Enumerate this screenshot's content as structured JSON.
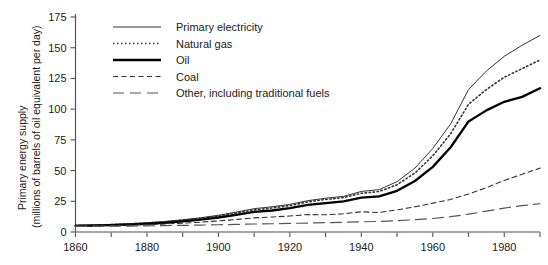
{
  "chart_data": {
    "type": "line",
    "title": "",
    "ylabel_line1": "Primary energy supply",
    "ylabel_line2": "(millions of barrels of oil equivalent per day)",
    "xlabel": "",
    "xlim": [
      1860,
      1990
    ],
    "ylim": [
      0,
      175
    ],
    "yticks": [
      0,
      25,
      50,
      75,
      100,
      125,
      150,
      175
    ],
    "ytick_labels": [
      "0",
      "25",
      "50",
      "75",
      "100",
      "125",
      "150",
      "175"
    ],
    "xticks_major": [
      1860,
      1880,
      1900,
      1920,
      1940,
      1960,
      1980
    ],
    "xtick_labels": [
      "1860",
      "1880",
      "1900",
      "1920",
      "1940",
      "1960",
      "1980"
    ],
    "xticks_minor": [
      1870,
      1890,
      1910,
      1930,
      1950,
      1970,
      1990
    ],
    "grid": false,
    "legend_position": "top-left-inside",
    "x": [
      1860,
      1865,
      1870,
      1875,
      1880,
      1885,
      1890,
      1895,
      1900,
      1905,
      1910,
      1915,
      1920,
      1925,
      1930,
      1935,
      1940,
      1945,
      1950,
      1955,
      1960,
      1965,
      1970,
      1975,
      1980,
      1985,
      1990
    ],
    "series": [
      {
        "name": "Primary electricity",
        "style": "thin-solid",
        "color": "#333333",
        "values": [
          5.5,
          5.8,
          6.2,
          6.8,
          7.6,
          8.6,
          10.0,
          11.6,
          13.6,
          16.2,
          19.0,
          20.5,
          22.5,
          25.5,
          27.5,
          29.0,
          33.0,
          34.5,
          41.0,
          52.0,
          68.0,
          88.0,
          116.0,
          131.0,
          143.0,
          152.0,
          160.0
        ]
      },
      {
        "name": "Natural gas",
        "style": "dotted",
        "color": "#333333",
        "values": [
          5.3,
          5.6,
          6.0,
          6.5,
          7.3,
          8.2,
          9.5,
          11.0,
          13.0,
          15.4,
          18.0,
          19.5,
          21.5,
          24.5,
          26.5,
          28.0,
          31.5,
          33.0,
          38.5,
          48.0,
          62.0,
          80.0,
          104.0,
          116.0,
          126.0,
          133.0,
          140.0
        ]
      },
      {
        "name": "Oil",
        "style": "thick-solid",
        "color": "#000000",
        "values": [
          5.0,
          5.2,
          5.6,
          6.0,
          6.6,
          7.4,
          8.6,
          10.0,
          11.8,
          14.0,
          16.4,
          17.5,
          19.5,
          22.0,
          23.5,
          25.0,
          28.0,
          29.0,
          33.5,
          41.5,
          53.0,
          69.0,
          90.0,
          99.0,
          106.0,
          110.0,
          117.0
        ]
      },
      {
        "name": "Coal",
        "style": "short-dash",
        "color": "#333333",
        "values": [
          5.0,
          5.1,
          5.3,
          5.6,
          6.0,
          6.5,
          7.2,
          8.0,
          9.0,
          10.2,
          11.5,
          12.2,
          13.0,
          14.2,
          14.0,
          14.8,
          16.5,
          15.8,
          18.0,
          20.5,
          23.5,
          26.5,
          31.0,
          36.0,
          42.0,
          47.0,
          52.0
        ]
      },
      {
        "name": "Other, including traditional fuels",
        "style": "long-dash",
        "color": "#555555",
        "values": [
          4.5,
          4.6,
          4.7,
          4.8,
          5.0,
          5.2,
          5.4,
          5.6,
          5.9,
          6.2,
          6.5,
          6.7,
          7.0,
          7.3,
          7.6,
          7.9,
          8.3,
          8.6,
          9.2,
          10.0,
          11.0,
          12.5,
          14.5,
          17.0,
          19.5,
          21.5,
          23.0
        ]
      }
    ],
    "legend": [
      {
        "label": "Primary electricity",
        "style": "thin-solid"
      },
      {
        "label": "Natural gas",
        "style": "dotted"
      },
      {
        "label": "Oil",
        "style": "thick-solid"
      },
      {
        "label": "Coal",
        "style": "short-dash"
      },
      {
        "label": "Other, including traditional fuels",
        "style": "long-dash"
      }
    ]
  }
}
